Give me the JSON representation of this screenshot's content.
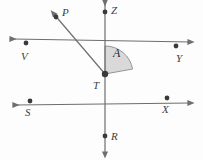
{
  "figure": {
    "background_color": "#fdfdfd",
    "stroke_color": "#6e6e6e",
    "label_color": "#3d3d3d",
    "arc_fill_color": "#d9d9d9",
    "arc_stroke_color": "#8a8a8a",
    "dot_color": "#3a3a3a",
    "width": 203,
    "height": 160
  },
  "vertex": {
    "name": "T",
    "label": "T",
    "x": 105,
    "y": 74,
    "label_x": 93,
    "label_y": 80
  },
  "points": [
    {
      "id": "P",
      "label": "P",
      "x": 56,
      "y": 17,
      "label_x": 62,
      "label_y": 7,
      "dot": true
    },
    {
      "id": "Z",
      "label": "Z",
      "x": 105,
      "y": 12,
      "label_x": 111,
      "label_y": 5,
      "dot": true
    },
    {
      "id": "V",
      "label": "V",
      "x": 26,
      "y": 43,
      "label_x": 21,
      "label_y": 51,
      "dot": true
    },
    {
      "id": "Y",
      "label": "Y",
      "x": 176,
      "y": 46,
      "label_x": 176,
      "label_y": 53,
      "dot": true
    },
    {
      "id": "S",
      "label": "S",
      "x": 30,
      "y": 101,
      "label_x": 25,
      "label_y": 107,
      "dot": true
    },
    {
      "id": "X",
      "label": "X",
      "x": 167,
      "y": 98,
      "label_x": 162,
      "label_y": 104,
      "dot": true
    },
    {
      "id": "R",
      "label": "R",
      "x": 105,
      "y": 136,
      "label_x": 111,
      "label_y": 131,
      "dot": true
    }
  ],
  "lines": [
    {
      "id": "line-ZR",
      "from": "Z-end",
      "to": "R-end",
      "x1": 105,
      "y1": 3,
      "x2": 105,
      "y2": 155,
      "through": [
        "Z",
        "T",
        "R"
      ]
    },
    {
      "id": "line-VY",
      "from": "V-end",
      "to": "Y-end",
      "x1": 13,
      "y1": 39,
      "x2": 191,
      "y2": 42,
      "through": [
        "V",
        "T",
        "Y"
      ]
    },
    {
      "id": "line-SX",
      "from": "S-end",
      "to": "X-end",
      "x1": 16,
      "y1": 105,
      "x2": 191,
      "y2": 103,
      "through": [
        "S",
        "T",
        "X"
      ]
    }
  ],
  "rays": [
    {
      "id": "ray-TP",
      "from": "T",
      "to": "P",
      "x1": 105,
      "y1": 74,
      "x2": 53,
      "y2": 13
    }
  ],
  "angle": {
    "id": "angle-A",
    "label": "A",
    "vertex": "T",
    "from_ray": "TZ",
    "to_ray": "TY",
    "radius": 28,
    "label_x": 113,
    "label_y": 47
  }
}
